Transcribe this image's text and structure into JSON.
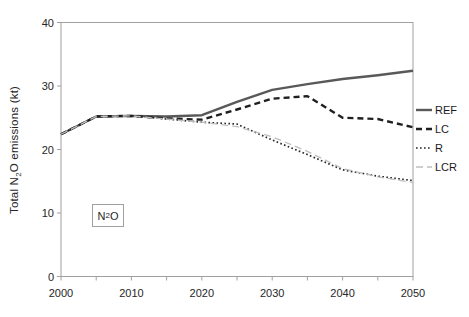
{
  "figure": {
    "background": "#ffffff",
    "axis_color": "#a0a0a0",
    "text_color": "#262626"
  },
  "chart_data": {
    "type": "line",
    "title": "",
    "xlabel": "",
    "ylabel": "Total N2O emissions (kt)",
    "ylabel_parts": {
      "prefix": "Total N",
      "sub": "2",
      "suffix": "O emissions (kt)"
    },
    "annotation_box": {
      "label": "N2O",
      "prefix": "N",
      "sub": "2",
      "suffix": "O"
    },
    "xlim": [
      2000,
      2050
    ],
    "ylim": [
      0,
      40
    ],
    "y_ticks": [
      0,
      10,
      20,
      30,
      40
    ],
    "x_labeled_ticks": [
      2000,
      2010,
      2020,
      2030,
      2040,
      2050
    ],
    "x_minor_tick_step": 5,
    "grid": false,
    "legend_position": "right-outside",
    "x": [
      2000,
      2005,
      2010,
      2015,
      2020,
      2025,
      2030,
      2035,
      2040,
      2045,
      2050
    ],
    "series": [
      {
        "name": "REF",
        "style": "solid",
        "color": "#595959",
        "values": [
          22.4,
          25.2,
          25.3,
          25.2,
          25.4,
          27.5,
          29.4,
          30.3,
          31.1,
          31.7,
          32.4
        ]
      },
      {
        "name": "LC",
        "style": "dashed",
        "color": "#1f1f1f",
        "values": [
          22.4,
          25.2,
          25.3,
          24.9,
          24.7,
          26.3,
          28.0,
          28.4,
          25.0,
          24.8,
          23.5
        ]
      },
      {
        "name": "R",
        "style": "dotted",
        "color": "#262626",
        "values": [
          22.4,
          25.2,
          25.3,
          24.8,
          24.3,
          24.0,
          21.5,
          19.2,
          16.8,
          15.8,
          15.1
        ]
      },
      {
        "name": "LCR",
        "style": "light-dashed",
        "color": "#bfbfbf",
        "values": [
          22.4,
          25.2,
          25.3,
          24.8,
          24.3,
          23.6,
          22.0,
          19.7,
          17.0,
          15.7,
          14.8
        ]
      }
    ]
  }
}
